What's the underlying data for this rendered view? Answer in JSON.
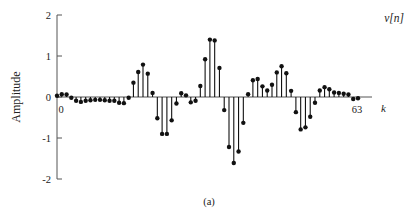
{
  "chart_data": {
    "type": "scatter",
    "plot_style": "stem",
    "title": "",
    "subtitle": "",
    "caption": "(a)",
    "series_label": "v[n]",
    "xlabel": "k",
    "ylabel": "Amplitude",
    "xlim": [
      0,
      63
    ],
    "ylim": [
      -2,
      2
    ],
    "yticks": [
      2,
      1,
      0,
      -1,
      -2
    ],
    "ytick_labels": [
      "2",
      "1",
      "0",
      "-1",
      "-2"
    ],
    "xticks": [
      0,
      63
    ],
    "xtick_labels": [
      "0",
      "63"
    ],
    "grid": false,
    "legend": "none",
    "x": [
      0,
      1,
      2,
      3,
      4,
      5,
      6,
      7,
      8,
      9,
      10,
      11,
      12,
      13,
      14,
      15,
      16,
      17,
      18,
      19,
      20,
      21,
      22,
      23,
      24,
      25,
      26,
      27,
      28,
      29,
      30,
      31,
      32,
      33,
      34,
      35,
      36,
      37,
      38,
      39,
      40,
      41,
      42,
      43,
      44,
      45,
      46,
      47,
      48,
      49,
      50,
      51,
      52,
      53,
      54,
      55,
      56,
      57,
      58,
      59,
      60,
      61,
      62,
      63
    ],
    "values": [
      0.03,
      0.07,
      0.06,
      -0.02,
      -0.09,
      -0.12,
      -0.09,
      -0.08,
      -0.07,
      -0.07,
      -0.08,
      -0.09,
      -0.09,
      -0.14,
      -0.15,
      -0.02,
      0.35,
      0.61,
      0.79,
      0.57,
      0.1,
      -0.52,
      -0.9,
      -0.9,
      -0.57,
      -0.16,
      0.09,
      0.04,
      -0.13,
      -0.09,
      0.27,
      0.92,
      1.4,
      1.38,
      0.71,
      -0.32,
      -1.22,
      -1.61,
      -1.33,
      -0.63,
      0.07,
      0.41,
      0.44,
      0.26,
      0.16,
      0.3,
      0.6,
      0.75,
      0.58,
      0.15,
      -0.37,
      -0.79,
      -0.74,
      -0.48,
      -0.14,
      0.16,
      0.24,
      0.19,
      0.11,
      0.1,
      0.08,
      0.06,
      -0.05,
      -0.03
    ],
    "marker": "filled-circle",
    "marker_color": "#111111",
    "stem_color": "#111111",
    "axis_color": "#555555",
    "background": "#ffffff"
  },
  "figure": {
    "y_axis_title": "Amplitude",
    "x_axis_name": "k",
    "series_name": "v[n]",
    "caption": "(a)",
    "x_start_label": "0",
    "x_end_label": "63",
    "ytick_labels": [
      "2",
      "1",
      "0",
      "-1",
      "-2"
    ]
  }
}
